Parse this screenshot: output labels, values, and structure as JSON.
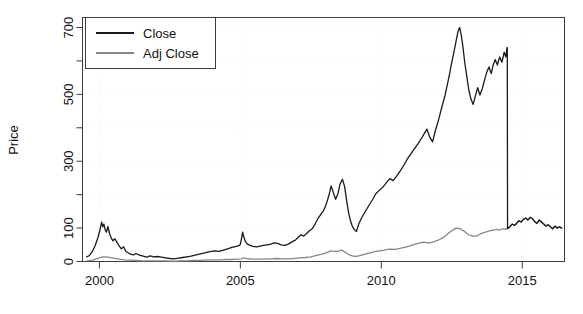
{
  "chart_data": {
    "type": "line",
    "title": "",
    "subtitle": "",
    "xlabel": "",
    "ylabel": "Price",
    "xlim": [
      1999.4,
      2016.5
    ],
    "ylim": [
      0,
      730
    ],
    "grid": true,
    "grid_style": "dotted-faint",
    "legend": {
      "position": "top-left",
      "boxed": true,
      "entries": [
        {
          "label": "Close",
          "color": "#1a1a1a",
          "width": 1.4
        },
        {
          "label": "Adj Close",
          "color": "#878787",
          "width": 1.4
        }
      ]
    },
    "xticks": [
      2000,
      2005,
      2010,
      2015
    ],
    "xtick_labels": [
      "2000",
      "2005",
      "2010",
      "2015"
    ],
    "yticks": [
      0,
      100,
      200,
      300,
      400,
      500,
      600,
      700
    ],
    "ytick_labels": [
      "0",
      "100",
      "",
      "300",
      "",
      "500",
      "",
      "700"
    ],
    "ytick_labeled": [
      0,
      100,
      300,
      500,
      700
    ],
    "series": [
      {
        "name": "Close",
        "color": "#1a1a1a",
        "x": [
          1999.55,
          1999.65,
          1999.75,
          1999.85,
          1999.95,
          2000.02,
          2000.08,
          2000.12,
          2000.16,
          2000.2,
          2000.25,
          2000.3,
          2000.36,
          2000.42,
          2000.48,
          2000.55,
          2000.62,
          2000.7,
          2000.78,
          2000.86,
          2000.94,
          2001.02,
          2001.1,
          2001.2,
          2001.3,
          2001.42,
          2001.55,
          2001.68,
          2001.8,
          2001.92,
          2002.05,
          2002.2,
          2002.35,
          2002.5,
          2002.65,
          2002.8,
          2002.95,
          2003.1,
          2003.25,
          2003.4,
          2003.55,
          2003.7,
          2003.85,
          2003.97,
          2004.1,
          2004.25,
          2004.4,
          2004.55,
          2004.7,
          2004.85,
          2004.97,
          2005.0,
          2005.04,
          2005.08,
          2005.12,
          2005.18,
          2005.25,
          2005.35,
          2005.45,
          2005.58,
          2005.7,
          2005.82,
          2005.95,
          2006.08,
          2006.2,
          2006.32,
          2006.45,
          2006.58,
          2006.7,
          2006.82,
          2006.95,
          2007.05,
          2007.15,
          2007.25,
          2007.35,
          2007.45,
          2007.55,
          2007.65,
          2007.75,
          2007.85,
          2007.95,
          2008.04,
          2008.1,
          2008.16,
          2008.22,
          2008.3,
          2008.38,
          2008.46,
          2008.54,
          2008.62,
          2008.7,
          2008.78,
          2008.85,
          2008.92,
          2008.97,
          2009.04,
          2009.12,
          2009.2,
          2009.3,
          2009.42,
          2009.55,
          2009.68,
          2009.8,
          2009.92,
          2010.05,
          2010.18,
          2010.3,
          2010.42,
          2010.55,
          2010.68,
          2010.8,
          2010.92,
          2011.05,
          2011.18,
          2011.3,
          2011.42,
          2011.52,
          2011.62,
          2011.72,
          2011.82,
          2011.92,
          2012.02,
          2012.1,
          2012.18,
          2012.26,
          2012.34,
          2012.42,
          2012.5,
          2012.58,
          2012.66,
          2012.72,
          2012.78,
          2012.84,
          2012.9,
          2012.96,
          2013.02,
          2013.1,
          2013.18,
          2013.26,
          2013.34,
          2013.42,
          2013.5,
          2013.58,
          2013.66,
          2013.74,
          2013.82,
          2013.9,
          2013.97,
          2014.04,
          2014.12,
          2014.2,
          2014.28,
          2014.36,
          2014.42,
          2014.46,
          2014.47,
          2014.48,
          2014.56,
          2014.64,
          2014.72,
          2014.8,
          2014.88,
          2014.96,
          2015.04,
          2015.12,
          2015.2,
          2015.28,
          2015.36,
          2015.44,
          2015.52,
          2015.6,
          2015.68,
          2015.76,
          2015.84,
          2015.92,
          2016.0,
          2016.08,
          2016.16,
          2016.24,
          2016.32,
          2016.4
        ],
        "y": [
          14,
          18,
          30,
          48,
          72,
          95,
          118,
          104,
          112,
          96,
          88,
          105,
          83,
          70,
          62,
          68,
          58,
          47,
          38,
          44,
          30,
          26,
          22,
          20,
          24,
          19,
          16,
          13,
          17,
          14,
          15,
          13,
          11,
          9,
          8,
          10,
          12,
          14,
          16,
          19,
          22,
          25,
          28,
          30,
          32,
          30,
          34,
          38,
          42,
          45,
          48,
          52,
          68,
          88,
          74,
          60,
          52,
          48,
          45,
          44,
          46,
          48,
          50,
          52,
          56,
          54,
          50,
          48,
          52,
          58,
          64,
          72,
          80,
          76,
          84,
          92,
          98,
          112,
          128,
          140,
          152,
          170,
          186,
          204,
          226,
          206,
          186,
          202,
          232,
          246,
          224,
          176,
          142,
          118,
          106,
          96,
          90,
          112,
          130,
          148,
          166,
          184,
          202,
          212,
          222,
          236,
          248,
          242,
          256,
          272,
          288,
          306,
          322,
          338,
          352,
          368,
          382,
          396,
          372,
          358,
          392,
          420,
          446,
          472,
          496,
          528,
          560,
          596,
          628,
          662,
          688,
          700,
          676,
          640,
          596,
          562,
          516,
          486,
          470,
          496,
          520,
          498,
          516,
          542,
          566,
          582,
          562,
          588,
          604,
          588,
          612,
          596,
          626,
          612,
          640,
          640,
          98,
          104,
          112,
          108,
          114,
          122,
          118,
          126,
          130,
          124,
          132,
          128,
          120,
          114,
          124,
          118,
          112,
          106,
          110,
          104,
          98,
          106,
          100,
          104,
          100
        ]
      },
      {
        "name": "Adj Close",
        "color": "#878787",
        "x": [
          1999.55,
          1999.75,
          1999.95,
          2000.1,
          2000.3,
          2000.5,
          2000.7,
          2000.9,
          2001.1,
          2001.3,
          2001.5,
          2001.7,
          2001.9,
          2002.1,
          2002.3,
          2002.5,
          2002.7,
          2002.9,
          2003.1,
          2003.3,
          2003.5,
          2003.7,
          2003.9,
          2004.1,
          2004.3,
          2004.5,
          2004.7,
          2004.9,
          2005.05,
          2005.1,
          2005.2,
          2005.4,
          2005.6,
          2005.8,
          2005.95,
          2006.1,
          2006.3,
          2006.5,
          2006.7,
          2006.9,
          2007.1,
          2007.3,
          2007.5,
          2007.7,
          2007.9,
          2008.05,
          2008.2,
          2008.3,
          2008.45,
          2008.6,
          2008.75,
          2008.9,
          2009.05,
          2009.2,
          2009.4,
          2009.6,
          2009.8,
          2009.95,
          2010.1,
          2010.3,
          2010.5,
          2010.7,
          2010.9,
          2011.1,
          2011.3,
          2011.5,
          2011.7,
          2011.9,
          2012.05,
          2012.2,
          2012.35,
          2012.5,
          2012.65,
          2012.8,
          2012.95,
          2013.1,
          2013.25,
          2013.4,
          2013.55,
          2013.7,
          2013.85,
          2013.97,
          2014.1,
          2014.2,
          2014.3,
          2014.4,
          2014.47,
          2014.56,
          2014.64,
          2014.72,
          2014.8,
          2014.88,
          2014.96,
          2015.04,
          2015.12,
          2015.2,
          2015.28,
          2015.36,
          2015.44,
          2015.52,
          2015.6,
          2015.68,
          2015.76,
          2015.84,
          2015.92,
          2016.0,
          2016.08,
          2016.16,
          2016.24,
          2016.32,
          2016.4
        ],
        "y": [
          2,
          4,
          9,
          14,
          13,
          10,
          7,
          5,
          4,
          3,
          2,
          2,
          2,
          2,
          2,
          1,
          1,
          2,
          2,
          3,
          3,
          4,
          5,
          5,
          5,
          6,
          6,
          7,
          8,
          11,
          9,
          7,
          7,
          7,
          8,
          8,
          9,
          8,
          8,
          9,
          11,
          12,
          14,
          18,
          22,
          26,
          32,
          30,
          30,
          34,
          26,
          18,
          15,
          17,
          21,
          26,
          30,
          32,
          34,
          37,
          36,
          40,
          44,
          49,
          54,
          58,
          55,
          60,
          65,
          72,
          82,
          92,
          100,
          98,
          90,
          80,
          75,
          77,
          84,
          88,
          92,
          94,
          96,
          94,
          98,
          96,
          100,
          104,
          112,
          108,
          114,
          122,
          118,
          126,
          130,
          124,
          132,
          128,
          120,
          114,
          124,
          118,
          112,
          106,
          110,
          104,
          98,
          106,
          100,
          104,
          100
        ]
      }
    ]
  },
  "axes": {
    "ylabel": "Price",
    "xtick_labels": [
      "2000",
      "2005",
      "2010",
      "2015"
    ],
    "ytick_labels": [
      "0",
      "100",
      "300",
      "500",
      "700"
    ]
  },
  "legend": {
    "close_label": "Close",
    "adj_close_label": "Adj Close"
  },
  "colors": {
    "close_line": "#1a1a1a",
    "adj_close_line": "#878787",
    "axis": "#3c3c3c",
    "grid": "#f0f0f0",
    "background": "#ffffff",
    "text": "#111111"
  }
}
